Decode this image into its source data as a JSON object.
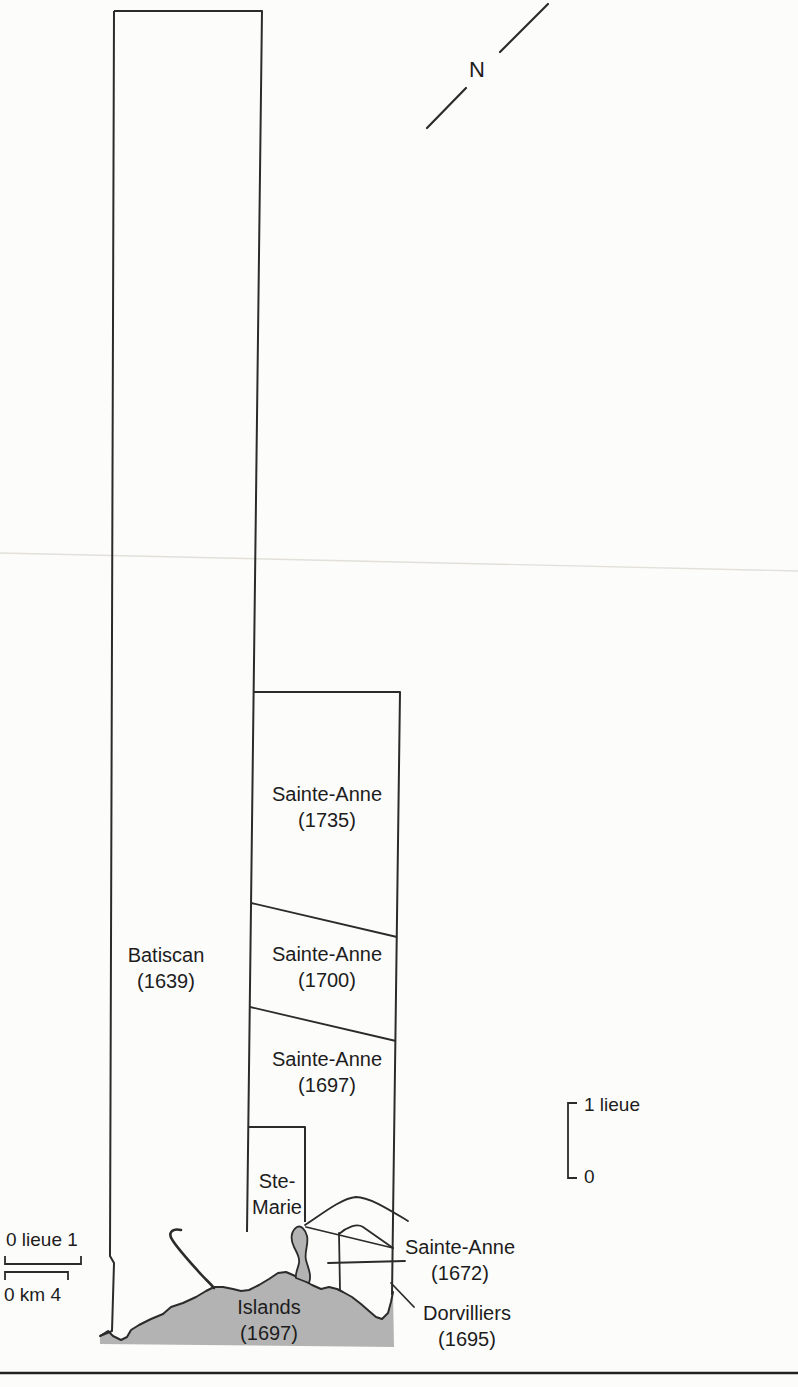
{
  "map": {
    "description": "Historical seigneury map (Batiscan / Sainte-Anne area)",
    "north_indicator": {
      "label": "N"
    },
    "parcels": [
      {
        "name": "Batiscan",
        "year": "(1639)"
      },
      {
        "name": "Sainte-Anne",
        "year": "(1735)"
      },
      {
        "name": "Sainte-Anne",
        "year": "(1700)"
      },
      {
        "name": "Sainte-Anne",
        "year": "(1697)"
      },
      {
        "name": "Ste-",
        "name_line2": "Marie"
      },
      {
        "name": "Sainte-Anne",
        "year": "(1672)"
      },
      {
        "name": "Dorvilliers",
        "year": "(1695)"
      },
      {
        "name": "Islands",
        "year": "(1697)"
      }
    ],
    "scale_vertical": {
      "top_label": "1 lieue",
      "bottom_label": "0"
    },
    "scale_horizontal": {
      "lieue_label": "0 lieue 1",
      "km_label": "0 km 4"
    },
    "colors": {
      "water": "#b3b3b3",
      "line": "#2b2b2b",
      "paper": "#fcfcfb",
      "text": "#1d1d1d"
    }
  }
}
